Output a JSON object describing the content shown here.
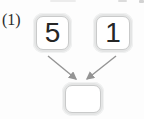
{
  "problem": {
    "label": "(1)",
    "addends": [
      {
        "value": "5"
      },
      {
        "value": "1"
      }
    ],
    "result": {
      "value": ""
    }
  },
  "colors": {
    "background": "#fdfdfd",
    "box_fill": "#e4e5e5",
    "box_keyline": "#c9caca",
    "arrow": "#949494",
    "text": "#262626",
    "label_color": "#2b2b2b"
  }
}
